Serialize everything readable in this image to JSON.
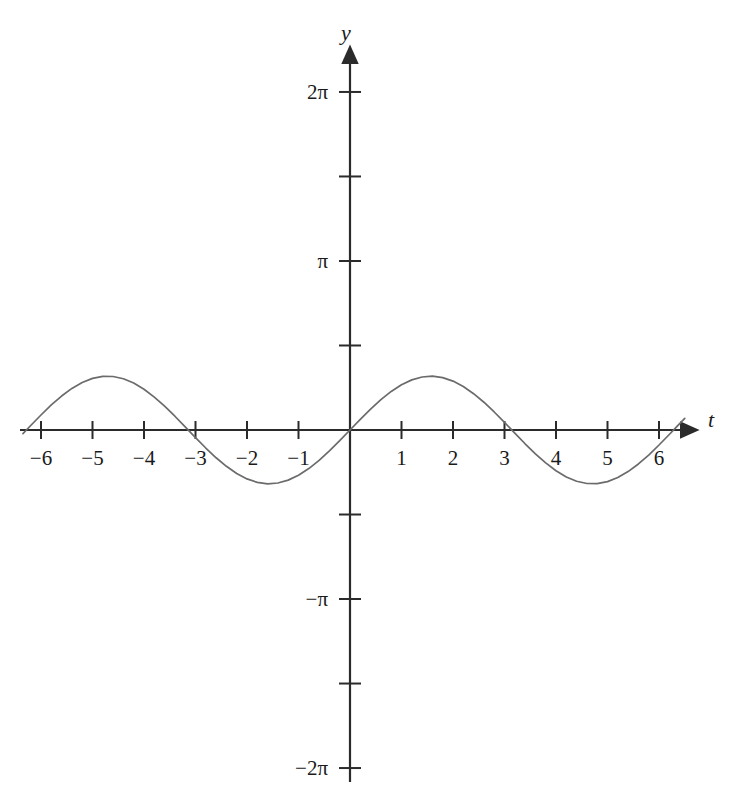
{
  "figure": {
    "background_color": "#ffffff",
    "axis_color": "#2b2b2b",
    "curve_color": "#6b6b6b",
    "text_color": "#1a1a1a"
  },
  "axes": {
    "x_axis_name": "t",
    "y_axis_name": "y",
    "x_tick_labels": [
      "−6",
      "−5",
      "−4",
      "−3",
      "−2",
      "−1",
      "1",
      "2",
      "3",
      "4",
      "5",
      "6"
    ],
    "x_tick_values": [
      -6,
      -5,
      -4,
      -3,
      -2,
      -1,
      1,
      2,
      3,
      4,
      5,
      6
    ],
    "y_tick_labels": [
      "2π",
      "π",
      "−π",
      "−2π"
    ],
    "y_tick_labels_all": [
      "2π",
      "",
      "π",
      "",
      "",
      "",
      "−π",
      "",
      "−2π"
    ],
    "y_tick_values": [
      6.283185,
      4.712389,
      3.141593,
      1.570796,
      -1.570796,
      -3.141593,
      -4.712389,
      -6.283185
    ],
    "y_labeled_values": [
      6.283185,
      3.141593,
      -3.141593,
      -6.283185
    ]
  },
  "chart_data": {
    "type": "line",
    "title": "",
    "subtitle": "",
    "xlabel": "t",
    "ylabel": "y",
    "xlim": [
      -6.5,
      6.6
    ],
    "ylim": [
      -6.283185,
      6.283185
    ],
    "grid": false,
    "legend": null,
    "function": "y = sin(t)",
    "amplitude": 1,
    "period": 6.283185,
    "zero_crossings": [
      -6.283185,
      -3.141593,
      0,
      3.141593,
      6.283185
    ],
    "maxima": [
      {
        "x": -4.712389,
        "y": 1
      },
      {
        "x": 1.570796,
        "y": 1
      }
    ],
    "minima": [
      {
        "x": -1.570796,
        "y": -1
      },
      {
        "x": 4.712389,
        "y": -1
      }
    ],
    "x_tick_labels": [
      "−6",
      "−5",
      "−4",
      "−3",
      "−2",
      "−1",
      "1",
      "2",
      "3",
      "4",
      "5",
      "6"
    ],
    "y_tick_labels": [
      "2π",
      "π",
      "−π",
      "−2π"
    ],
    "series": [
      {
        "name": "sin(t)",
        "x": [
          -6.35,
          -6.2,
          -6.0,
          -5.8,
          -5.6,
          -5.4,
          -5.2,
          -5.0,
          -4.8,
          -4.6,
          -4.4,
          -4.2,
          -4.0,
          -3.8,
          -3.6,
          -3.4,
          -3.2,
          -3.0,
          -2.8,
          -2.6,
          -2.4,
          -2.2,
          -2.0,
          -1.8,
          -1.6,
          -1.4,
          -1.2,
          -1.0,
          -0.8,
          -0.6,
          -0.4,
          -0.2,
          0.0,
          0.2,
          0.4,
          0.6,
          0.8,
          1.0,
          1.2,
          1.4,
          1.6,
          1.8,
          2.0,
          2.2,
          2.4,
          2.6,
          2.8,
          3.0,
          3.2,
          3.4,
          3.6,
          3.8,
          4.0,
          4.2,
          4.4,
          4.6,
          4.8,
          5.0,
          5.2,
          5.4,
          5.6,
          5.8,
          6.0,
          6.2,
          6.35,
          6.5
        ],
        "y": [
          -0.066,
          0.083,
          0.279,
          0.465,
          0.631,
          0.773,
          0.883,
          0.959,
          0.996,
          0.994,
          0.952,
          0.872,
          0.757,
          0.612,
          0.443,
          0.256,
          0.058,
          -0.141,
          -0.335,
          -0.516,
          -0.675,
          -0.808,
          -0.909,
          -0.974,
          -1.0,
          -0.985,
          -0.932,
          -0.841,
          -0.717,
          -0.565,
          -0.389,
          -0.199,
          0.0,
          0.199,
          0.389,
          0.565,
          0.717,
          0.841,
          0.932,
          0.985,
          1.0,
          0.974,
          0.909,
          0.808,
          0.675,
          0.516,
          0.335,
          0.141,
          -0.058,
          -0.256,
          -0.443,
          -0.612,
          -0.757,
          -0.872,
          -0.952,
          -0.994,
          -0.996,
          -0.959,
          -0.883,
          -0.773,
          -0.631,
          -0.465,
          -0.279,
          -0.083,
          0.066,
          0.216
        ]
      }
    ]
  }
}
